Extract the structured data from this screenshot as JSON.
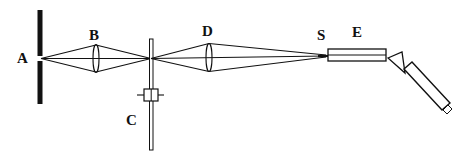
{
  "diagram": {
    "labels": {
      "A": "A",
      "B": "B",
      "C": "C",
      "D": "D",
      "S": "S",
      "E": "E"
    },
    "colors": {
      "ink": "#111111",
      "background": "#ffffff"
    }
  }
}
